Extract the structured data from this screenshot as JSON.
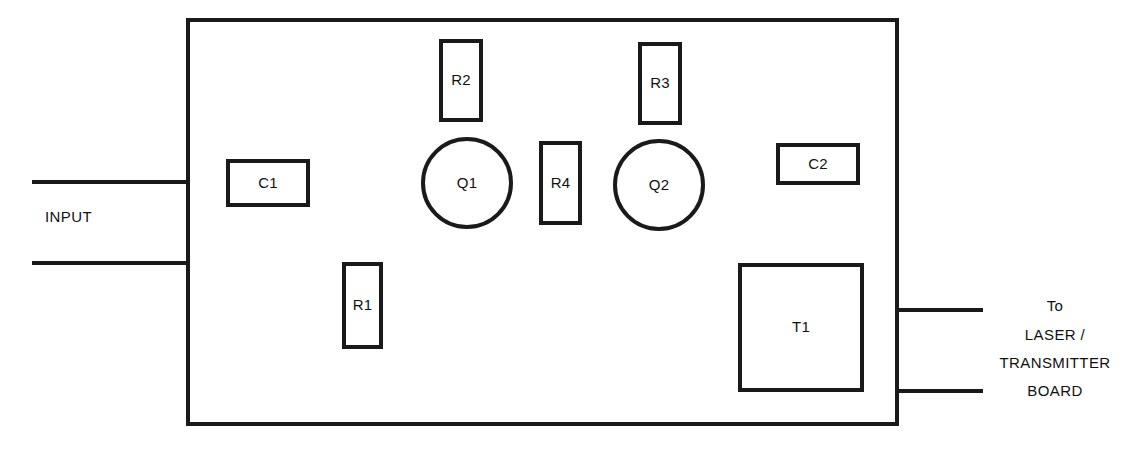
{
  "diagram": {
    "type": "pcb-component-layout",
    "canvas": {
      "width": 1144,
      "height": 451
    },
    "colors": {
      "background": "#ffffff",
      "stroke": "#1a1a1a",
      "text": "#111111",
      "fill": "#ffffff"
    },
    "board": {
      "name": "board-outline",
      "x": 188,
      "y": 20,
      "width": 709,
      "height": 404,
      "stroke_width": 4
    },
    "components": [
      {
        "id": "C1",
        "label": "C1",
        "kind": "capacitor",
        "shape": "rect",
        "x": 228,
        "y": 161,
        "width": 80,
        "height": 44,
        "stroke_width": 4
      },
      {
        "id": "R2",
        "label": "R2",
        "kind": "resistor",
        "shape": "rect",
        "x": 441,
        "y": 41,
        "width": 40,
        "height": 79,
        "stroke_width": 4
      },
      {
        "id": "R3",
        "label": "R3",
        "kind": "resistor",
        "shape": "rect",
        "x": 640,
        "y": 44,
        "width": 40,
        "height": 79,
        "stroke_width": 4
      },
      {
        "id": "R4",
        "label": "R4",
        "kind": "resistor",
        "shape": "rect",
        "x": 541,
        "y": 143,
        "width": 39,
        "height": 80,
        "stroke_width": 4
      },
      {
        "id": "R1",
        "label": "R1",
        "kind": "resistor",
        "shape": "rect",
        "x": 344,
        "y": 264,
        "width": 37,
        "height": 83,
        "stroke_width": 4
      },
      {
        "id": "C2",
        "label": "C2",
        "kind": "capacitor",
        "shape": "rect",
        "x": 778,
        "y": 145,
        "width": 80,
        "height": 38,
        "stroke_width": 4
      },
      {
        "id": "T1",
        "label": "T1",
        "kind": "transformer",
        "shape": "rect",
        "x": 740,
        "y": 265,
        "width": 122,
        "height": 125,
        "stroke_width": 4
      },
      {
        "id": "Q1",
        "label": "Q1",
        "kind": "transistor",
        "shape": "circle",
        "cx": 467,
        "cy": 183,
        "r": 44,
        "stroke_width": 4
      },
      {
        "id": "Q2",
        "label": "Q2",
        "kind": "transistor",
        "shape": "circle",
        "cx": 659,
        "cy": 185,
        "r": 44,
        "stroke_width": 4
      }
    ],
    "wires": [
      {
        "name": "input-wire-top",
        "x1": 32,
        "y1": 182,
        "x2": 190,
        "y2": 182,
        "stroke_width": 4
      },
      {
        "name": "input-wire-bottom",
        "x1": 32,
        "y1": 263,
        "x2": 190,
        "y2": 263,
        "stroke_width": 4
      },
      {
        "name": "output-wire-top",
        "x1": 895,
        "y1": 310,
        "x2": 983,
        "y2": 310,
        "stroke_width": 4
      },
      {
        "name": "output-wire-bottom",
        "x1": 895,
        "y1": 391,
        "x2": 983,
        "y2": 391,
        "stroke_width": 4
      }
    ],
    "annotations": {
      "input": {
        "name": "input-label",
        "text": "INPUT",
        "x": 45,
        "y": 222
      },
      "output": {
        "name": "output-destination-label",
        "center_x": 1055,
        "lines": [
          {
            "text": "To",
            "y": 311
          },
          {
            "text": "LASER /",
            "y": 340
          },
          {
            "text": "TRANSMITTER",
            "y": 368
          },
          {
            "text": "BOARD",
            "y": 396
          }
        ]
      }
    }
  }
}
